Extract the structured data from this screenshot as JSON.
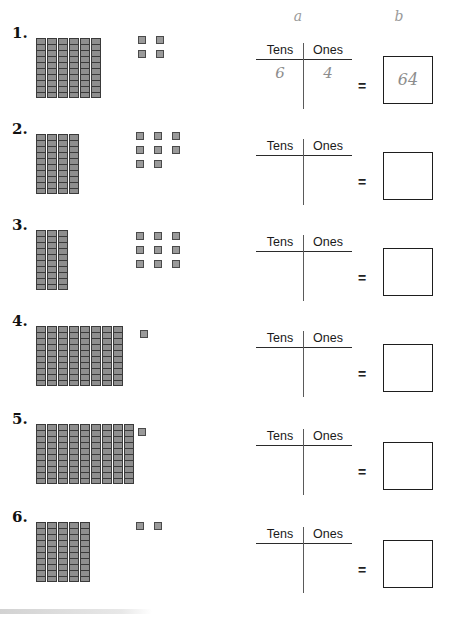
{
  "worksheet": {
    "column_headers": {
      "a": "a",
      "b": "b"
    },
    "place_value_labels": {
      "tens": "Tens",
      "ones": "Ones"
    },
    "equals_symbol": "=",
    "rows": [
      {
        "number": "1.",
        "tens_rods": 6,
        "ones_units": 4,
        "ones_layout": [
          2,
          2
        ],
        "tens_value": "6",
        "ones_value": "4",
        "answer": "64"
      },
      {
        "number": "2.",
        "tens_rods": 4,
        "ones_units": 8,
        "ones_layout": [
          3,
          3,
          2
        ],
        "tens_value": "",
        "ones_value": "",
        "answer": ""
      },
      {
        "number": "3.",
        "tens_rods": 3,
        "ones_units": 9,
        "ones_layout": [
          3,
          3,
          3
        ],
        "tens_value": "",
        "ones_value": "",
        "answer": ""
      },
      {
        "number": "4.",
        "tens_rods": 8,
        "ones_units": 1,
        "ones_layout": [
          1
        ],
        "tens_value": "",
        "ones_value": "",
        "answer": ""
      },
      {
        "number": "5.",
        "tens_rods": 9,
        "ones_units": 1,
        "ones_layout": [
          1
        ],
        "tens_value": "",
        "ones_value": "",
        "answer": ""
      },
      {
        "number": "6.",
        "tens_rods": 5,
        "ones_units": 2,
        "ones_layout": [
          2
        ],
        "tens_value": "",
        "ones_value": "",
        "answer": ""
      }
    ]
  },
  "colors": {
    "rod_fill": "#8e8e8e",
    "rod_border": "#3a3a3a",
    "unit_fill": "#9a9a9a",
    "unit_border": "#4a4a4a",
    "handwriting": "#8d8d8d",
    "rule": "#2b2b2b"
  }
}
